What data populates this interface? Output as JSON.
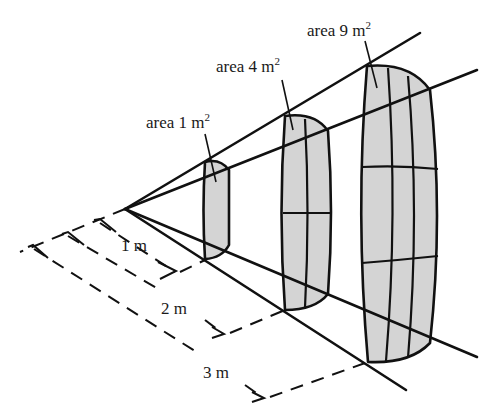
{
  "figure": {
    "fill_color": "#d4d4d4",
    "line_color": "#111111",
    "apex": [
      125,
      209
    ],
    "patches": [
      {
        "label_prefix": "area 1 m",
        "label_sup": "2",
        "distance_label": "1 m",
        "grid": "1x1"
      },
      {
        "label_prefix": "area 4 m",
        "label_sup": "2",
        "distance_label": "2 m",
        "grid": "2x2"
      },
      {
        "label_prefix": "area 9 m",
        "label_sup": "2",
        "distance_label": "3 m",
        "grid": "3x3"
      }
    ]
  }
}
